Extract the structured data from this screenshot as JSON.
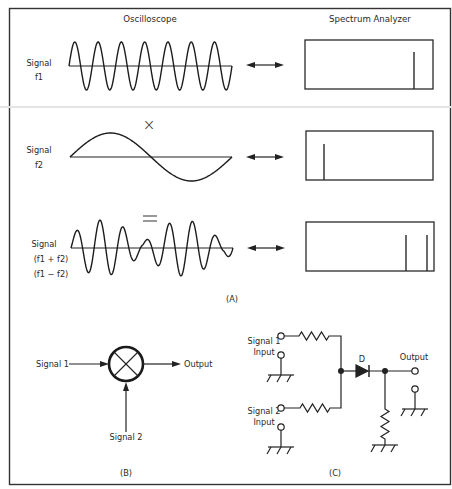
{
  "figure": {
    "border_color": "#333333",
    "background": "#ffffff",
    "ink": "#222222",
    "part_a": {
      "caption": "(A)",
      "oscilloscope_header": "Oscilloscope",
      "spectrum_header": "Spectrum Analyzer",
      "operator_multiply": "×",
      "operator_equals": "=",
      "rows": [
        {
          "id": "f1",
          "label_lines": [
            "Signal",
            "f1"
          ],
          "waveform": "sine",
          "cycles": 7,
          "spectrum_lines": [
            {
              "position": "high",
              "x": 414
            }
          ]
        },
        {
          "id": "f2",
          "label_lines": [
            "Signal",
            "f2"
          ],
          "waveform": "sine",
          "cycles": 1,
          "spectrum_lines": [
            {
              "position": "low",
              "x": 324
            }
          ]
        },
        {
          "id": "sum_diff",
          "label_lines": [
            "Signal",
            "(f1 + f2)",
            "(f1 − f2)"
          ],
          "waveform": "beat",
          "cycles": 7,
          "spectrum_lines": [
            {
              "position": "f1-f2",
              "x": 406
            },
            {
              "position": "f1+f2",
              "x": 427
            }
          ]
        }
      ]
    },
    "part_b": {
      "caption": "(B)",
      "input1_label": "Signal 1",
      "input2_label": "Signal 2",
      "output_label": "Output",
      "symbol": "mixer-circle-x"
    },
    "part_c": {
      "caption": "(C)",
      "input1_label_lines": [
        "Signal 1",
        "Input"
      ],
      "input2_label_lines": [
        "Signal 2",
        "Input"
      ],
      "diode_label": "D",
      "output_label": "Output"
    }
  }
}
